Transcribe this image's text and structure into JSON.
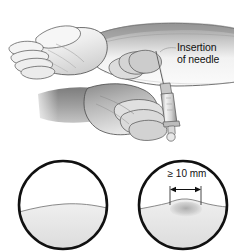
{
  "figure": {
    "background_color": "#ffffff",
    "width": 234,
    "height": 252
  },
  "top_panel": {
    "name": "injection-illustration",
    "description": "Forearm held palm-up while a second hand inserts a syringe needle intradermally into the volar forearm",
    "callout": {
      "line1": "Insertion",
      "line2": "of needle"
    },
    "elements": {
      "forearm_label": "forearm",
      "upper_hand_label": "patient-hand",
      "lower_hand_label": "clinician-hand",
      "syringe_label": "syringe",
      "needle_label": "needle"
    }
  },
  "bottom_panel": {
    "name": "reaction-comparison",
    "circles": [
      {
        "id": "negative-reaction",
        "label": "",
        "has_induration": false,
        "measurement": ""
      },
      {
        "id": "positive-reaction",
        "label": "",
        "has_induration": true,
        "measurement": "≥ 10 mm"
      }
    ]
  },
  "colors": {
    "outline": "#111111",
    "skin_light": "#ffffff",
    "skin_mid": "#d7d7d7",
    "skin_shadow": "#9a9a9a",
    "skin_dark": "#6f6f6f",
    "circle_fill": "#e9e9e9",
    "induration": "#bdbdbd",
    "text": "#111111"
  }
}
